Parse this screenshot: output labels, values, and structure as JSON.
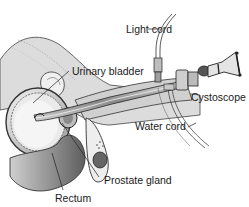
{
  "diagram": {
    "labels": {
      "light_cord": "Light cord",
      "urinary_bladder": "Urinary bladder",
      "cystoscope": "Cystoscope",
      "water_cord": "Water cord",
      "prostate_gland": "Prostate gland",
      "rectum": "Rectum"
    },
    "colors": {
      "outline": "#222222",
      "tissue_light": "#e6e6e6",
      "tissue_mid": "#bdbdbd",
      "tissue_dark": "#7a7a7a",
      "background": "#ffffff"
    }
  }
}
